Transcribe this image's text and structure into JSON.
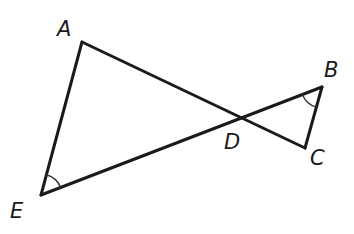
{
  "diagram": {
    "type": "geometry",
    "points": {
      "A": {
        "label": "A",
        "x": 82,
        "y": 42,
        "label_x": 57,
        "label_y": 36
      },
      "B": {
        "label": "B",
        "x": 322,
        "y": 87,
        "label_x": 324,
        "label_y": 77
      },
      "C": {
        "label": "C",
        "x": 305,
        "y": 148,
        "label_x": 310,
        "label_y": 165
      },
      "D": {
        "label": "D",
        "x": 238,
        "y": 118,
        "label_x": 224,
        "label_y": 149
      },
      "E": {
        "label": "E",
        "x": 41,
        "y": 195,
        "label_x": 10,
        "label_y": 218
      }
    },
    "segments": [
      {
        "from": "A",
        "to": "E"
      },
      {
        "from": "A",
        "to": "C"
      },
      {
        "from": "E",
        "to": "B"
      },
      {
        "from": "B",
        "to": "C"
      }
    ],
    "angle_marks": [
      {
        "vertex": "E",
        "between": [
          "A",
          "B"
        ],
        "arcs": 1
      },
      {
        "vertex": "B",
        "between": [
          "E",
          "C"
        ],
        "arcs": 1
      }
    ],
    "colors": {
      "stroke": "#1a1a1a",
      "background": "#ffffff"
    }
  }
}
